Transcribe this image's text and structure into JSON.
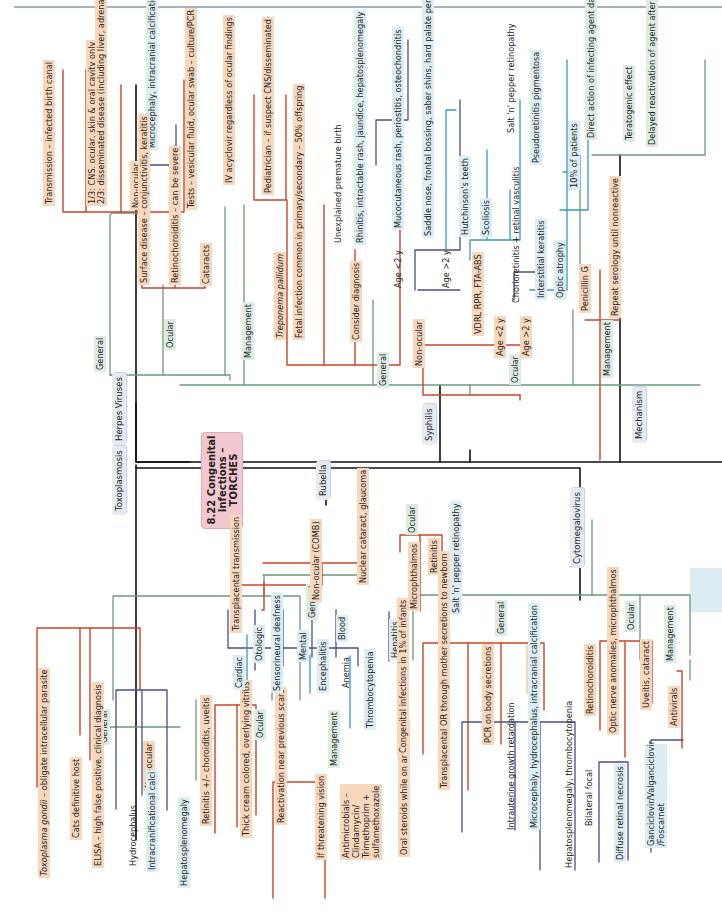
{
  "figure": {
    "title": "8.22 Congenital Infections – TORCHES",
    "colors": {
      "orange_box": "#f8d8bd",
      "blue_box": "#dceef4",
      "green_box": "#ddede4",
      "red_line": "#c8462a",
      "green_line": "#6a9a7c",
      "navy_line": "#4a4f86",
      "teal_line": "#3a9ac0",
      "black_line": "#111111",
      "center_node": "#f2c7cf"
    }
  },
  "categories": {
    "herpes": "Herpes Viruses",
    "toxo": "Toxoplasmosis",
    "syphilis": "Syphilis",
    "rubella": "Rubella",
    "mechanism": "Mechanism",
    "cmv": "Cytomegalovirus"
  },
  "herpes": {
    "general": "General",
    "transmission": "Transmission – infected birth canal",
    "one_third": "1/3: CNS, ocular, skin & oral cavity only",
    "two_third": "2/3: disseminated disease (including liver, adrenals, lungs)",
    "non_ocular": "Non-ocular",
    "micro": "Microcephaly, intracranial calcification",
    "tests": "Tests – vesicular fluid, ocular swab – culture/PCR",
    "ocular": "Ocular",
    "surface": "Surface disease – conjunctivitis, keratitis",
    "retino": "Retinochoroiditis – can be severe",
    "cataracts": "Cataracts",
    "management": "Management",
    "iv": "IV acyclovir regardless of ocular findings",
    "pediatrician": "Pediatrician – if suspect CNS/disseminated"
  },
  "syphilis": {
    "general": "General",
    "organism": "Treponema pallidum",
    "fetal": "Fetal infection common in primary/secondary – 50% offspring",
    "consider": "Consider diagnosis",
    "premature": "Unexplained premature birth",
    "rhinitis": "Rhinitis, intractable rash, jaundice, hepatosplenomegaly",
    "non_ocular": "Non-ocular",
    "age_lt2": "Age <2 y",
    "mucocutaneous": "Mucocutaneous rash, periostitis, osteochondritis",
    "age_gt2": "Age >2 y",
    "saddle": "Saddle nose, frontal bossing, saber shins, hard palate perforation",
    "hutchinson": "Hutchinson's teeth",
    "scoliosis": "Scoliosis",
    "vdrl": "VDRL RPR, FTA-ABS",
    "ocular": "Ocular",
    "oc_age_lt2": "Age <2 y",
    "chorio": "Chorioretinitis + retinal vasculitis",
    "saltpepper": "Salt 'n' pepper retinopathy",
    "pseudo": "Pseudoretinitis pigmentosa",
    "oc_age_gt2": "Age >2 y",
    "interstitial": "Interstitial keratitis",
    "optic": "Optic atrophy",
    "ten_pct": "10% of patients",
    "management": "Management",
    "penicillin": "Penicillin G",
    "repeat": "Repeat serology until nonreactive"
  },
  "mechanism": {
    "direct": "Direct action of infecting agent damages tissue",
    "teratogenic": "Teratogenic effect",
    "delayed": "Delayed reactivation of agent after birth"
  },
  "toxo": {
    "general": "General",
    "organism_italic": "Toxoplasma gondii",
    "organism_rest": " – obligate intracellular parasite",
    "cats": "Cats definitive host",
    "elisa": "ELISA – high false positive, clinical diagnosis",
    "non_ocular": "Non-ocular",
    "hydro": "Hydrocephalus",
    "intracranial": "Intracranificational calci",
    "hepato": "Hepatosplenomegaly",
    "ocular": "Ocular",
    "retinitis": "Retinitis +/– choroiditis, uveitis",
    "thick": "Thick cream colored, overlying vitritis",
    "reactivation": "Reactivation near previous scars",
    "management": "Management",
    "threatening": "If threatening vision",
    "antimicrobials": "Antimicrobials – Clindamycin/ Trimethoprim + sulfamethoxazole",
    "steroids": "Oral steroids while on antibiotics"
  },
  "rubella": {
    "general": "General",
    "transplacental": "Transplacental transmission",
    "non_ocular": "Non-ocular (COMB)",
    "cardiac": "Cardiac",
    "otologic": "Otologic",
    "deafness": "Sensorineural deafness",
    "mental": "Mental",
    "encephalitis": "Encephalitis",
    "blood": "Blood",
    "anemia": "Anemia",
    "thrombo": "Thrombocytopenia",
    "hepatitis": "Hepatitis",
    "ocular": "Ocular",
    "nuclear": "Nuclear cataract, glaucoma",
    "micro": "Microphthalmos",
    "retinitis": "Retinitis",
    "saltpepper": "Salt 'n' pepper retinopathy"
  },
  "cmv": {
    "general": "General",
    "congenital": "Congenital infections in 1% of infants",
    "transplacental": "Transplacental OR through mother secretions to newborn",
    "pcr": "PCR on body secretions",
    "non_ocular": "Non-ocular",
    "iugr": "Intrauterine growth retardation",
    "micro": "Microcephaly, hydrocephalus, intracranial calcification",
    "hepato": "Hepatosplenomegaly, thrombocytopenia",
    "ocular": "Ocular",
    "retino": "Retinochoroiditis",
    "bilateral": "Bilateral focal",
    "diffuse": "Diffuse retinal necrosis",
    "optic": "Optic nerve anomalies, microphthalmos",
    "uveitis": "Uveitis, cataract",
    "management": "Management",
    "antivirals": "Antivirals",
    "drugs": "Ganciclovir/Valganciclovir /Foscarnet"
  }
}
